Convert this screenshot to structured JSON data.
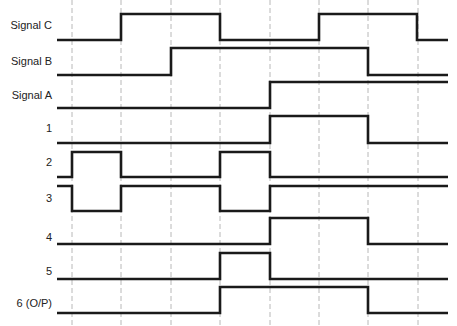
{
  "colors": {
    "waveform": "#1a1a1a",
    "gridline": "#b8b8b8",
    "background": "#ffffff",
    "label": "#222222"
  },
  "layout": {
    "x_start": 57,
    "x_end": 448,
    "gridlines_x": [
      72,
      121,
      171,
      220,
      270,
      319,
      368,
      418
    ]
  },
  "signals": [
    {
      "label": "Signal C",
      "label_y": 25,
      "low_y": 40,
      "high_y": 14,
      "initial": 0,
      "transitions": [
        121,
        220,
        319,
        417
      ],
      "levels": [
        0,
        1,
        0,
        1,
        0
      ]
    },
    {
      "label": "Signal B",
      "label_y": 61,
      "low_y": 75,
      "high_y": 48,
      "initial": 0,
      "transitions": [
        171,
        368
      ],
      "levels": [
        0,
        1,
        0
      ]
    },
    {
      "label": "Signal A",
      "label_y": 95,
      "low_y": 108,
      "high_y": 82,
      "initial": 0,
      "transitions": [
        270
      ],
      "levels": [
        0,
        1
      ]
    },
    {
      "label": "1",
      "label_y": 128,
      "low_y": 143,
      "high_y": 116,
      "initial": 0,
      "transitions": [
        270,
        368
      ],
      "levels": [
        0,
        1,
        0
      ]
    },
    {
      "label": "2",
      "label_y": 162,
      "low_y": 177,
      "high_y": 152,
      "initial": 0,
      "transitions": [
        72,
        121,
        220,
        270
      ],
      "levels": [
        0,
        1,
        0,
        1,
        0
      ]
    },
    {
      "label": "3",
      "label_y": 198,
      "low_y": 211,
      "high_y": 186,
      "initial": 1,
      "transitions": [
        72,
        121,
        220,
        270
      ],
      "levels": [
        1,
        0,
        1,
        0,
        1
      ]
    },
    {
      "label": "4",
      "label_y": 237,
      "low_y": 244,
      "high_y": 218,
      "initial": 0,
      "transitions": [
        270,
        368
      ],
      "levels": [
        0,
        1,
        0
      ]
    },
    {
      "label": "5",
      "label_y": 271,
      "low_y": 279,
      "high_y": 253,
      "initial": 0,
      "transitions": [
        220,
        270
      ],
      "levels": [
        0,
        1,
        0
      ]
    },
    {
      "label": "6 (O/P)",
      "label_y": 303,
      "low_y": 313,
      "high_y": 287,
      "initial": 0,
      "transitions": [
        220,
        368
      ],
      "levels": [
        0,
        1,
        0
      ]
    }
  ]
}
